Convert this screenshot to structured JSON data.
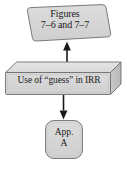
{
  "diagram": {
    "type": "flowchart",
    "canvas": {
      "width": 127,
      "height": 169,
      "background": "#ffffff"
    },
    "palette": {
      "shape_fill": "#d6d6d6",
      "shape_fill_light": "#e2e2e2",
      "shape_fill_dark": "#bdbdbd",
      "shape_stroke": "#6e6e6e",
      "text_color": "#1a1a1a",
      "arrow_color": "#1a1a1a"
    },
    "nodes": [
      {
        "id": "figures",
        "shape": "parallelogram",
        "line1": "Figures",
        "line2": "7–6 and 7–7"
      },
      {
        "id": "guess",
        "shape": "cuboid",
        "line1": "Use of “guess” in IRR"
      },
      {
        "id": "app-a",
        "shape": "rounded-rect",
        "line1": "App.",
        "line2": "A"
      }
    ],
    "connectors": [
      {
        "id": "guess-to-figures",
        "from": "guess",
        "to": "figures",
        "direction": "up"
      },
      {
        "id": "guess-to-app-a",
        "from": "guess",
        "to": "app-a",
        "direction": "down"
      }
    ]
  }
}
